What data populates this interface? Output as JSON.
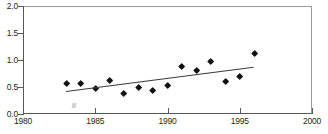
{
  "chart_data": {
    "type": "scatter",
    "title": "",
    "xlabel": "",
    "ylabel": "",
    "xlim": [
      1980,
      2000
    ],
    "ylim": [
      0.0,
      2.0
    ],
    "xticks": [
      1980,
      1985,
      1990,
      1995,
      2000
    ],
    "xtick_labels": [
      "1980",
      "1985",
      "1990",
      "1995",
      "2000"
    ],
    "yticks": [
      0.0,
      0.5,
      1.0,
      1.5,
      2.0
    ],
    "ytick_labels": [
      "0.0",
      "0.5",
      "1.0",
      "1.5",
      "2.0"
    ],
    "grid": false,
    "legend": null,
    "marker_style": "filled-diamond",
    "marker_color": "#111111",
    "line_color": "#3a3a3c",
    "series": [
      {
        "name": "observations",
        "x": [
          1983,
          1984,
          1985,
          1986,
          1987,
          1988,
          1989,
          1990,
          1991,
          1992,
          1993,
          1994,
          1995,
          1996
        ],
        "values": [
          0.56,
          0.57,
          0.47,
          0.61,
          0.38,
          0.49,
          0.44,
          0.53,
          0.88,
          0.8,
          0.96,
          0.6,
          0.7,
          1.12
        ]
      }
    ],
    "trend_line": {
      "name": "linear trend",
      "x_start": 1983,
      "y_start": 0.42,
      "x_end": 1996,
      "y_end": 0.87
    },
    "annotations": []
  },
  "axis": {
    "y_labels": [
      "2.0",
      "1.5",
      "1.0",
      "0.5",
      "0.0"
    ],
    "x_labels": [
      "1980",
      "1985",
      "1990",
      "1995",
      "2000"
    ]
  },
  "title_strip": ""
}
